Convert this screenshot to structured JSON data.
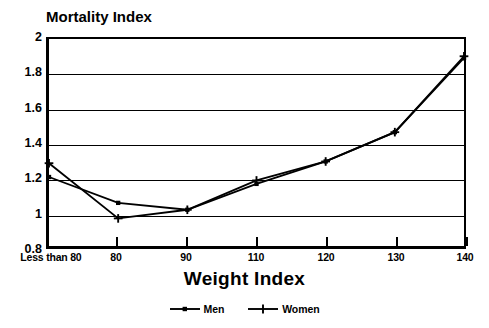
{
  "chart_data": {
    "type": "line",
    "title": "",
    "ylabel": "Mortality Index",
    "xlabel": "Weight Index",
    "categories": [
      "Less than 80",
      "80",
      "90",
      "110",
      "120",
      "130",
      "140"
    ],
    "series": [
      {
        "name": "Men",
        "marker": "square",
        "values": [
          1.2,
          1.05,
          1.01,
          1.16,
          1.29,
          1.46,
          1.89
        ]
      },
      {
        "name": "Women",
        "marker": "plus",
        "values": [
          1.28,
          0.96,
          1.01,
          1.18,
          1.29,
          1.46,
          1.9
        ]
      }
    ],
    "ylim": [
      0.8,
      2.0
    ],
    "y_ticks": [
      "0.8",
      "1",
      "1.2",
      "1.4",
      "1.6",
      "1.8",
      "2"
    ],
    "y_tick_values": [
      0.8,
      1.0,
      1.2,
      1.4,
      1.6,
      1.8,
      2.0
    ],
    "grid": "horizontal",
    "legend_position": "bottom-center",
    "line_color": "#000000",
    "background_color": "#ffffff"
  },
  "y_axis": {
    "title": "Mortality Index"
  },
  "x_axis": {
    "title": "Weight Index"
  },
  "legend": {
    "items": [
      {
        "label": "Men"
      },
      {
        "label": "Women"
      }
    ]
  }
}
